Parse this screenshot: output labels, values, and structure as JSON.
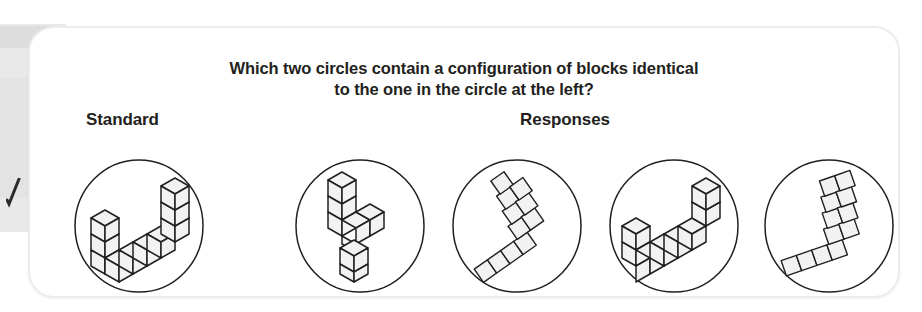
{
  "page": {
    "kind": "scanned-textbook-figure",
    "background_color": "#ffffff",
    "card_color": "#ffffff",
    "card_border_color": "#ececed",
    "ink_color": "#231f20",
    "block_face_color": "#f2f2f2",
    "scan_artifact_color": "#e8e8e8"
  },
  "question": {
    "line1": "Which two circles contain a configuration of blocks identical",
    "line2": "to the one in the circle at the left?"
  },
  "labels": {
    "standard": "Standard",
    "responses": "Responses"
  },
  "figure": {
    "standard_count": 1,
    "response_count": 4,
    "items": [
      {
        "id": "standard",
        "group": "standard",
        "name": "standard-block-figure",
        "description": "isometric checkmark of ten cubes, short arm lower-left, long arm rising to upper-right"
      },
      {
        "id": "response-1",
        "group": "response",
        "name": "response-block-figure-1",
        "description": "isometric figure with vertical column at top-left and detached lower column, not identical"
      },
      {
        "id": "response-2",
        "group": "response",
        "name": "response-block-figure-2",
        "description": "flat checkmark rotated, short arm to lower-left and long arm to upper-right"
      },
      {
        "id": "response-3",
        "group": "response",
        "name": "response-block-figure-3",
        "description": "isometric checkmark matching the standard, rotated"
      },
      {
        "id": "response-4",
        "group": "response",
        "name": "response-block-figure-4",
        "description": "flat checkmark with long arm near-vertical and short arm to lower-left"
      }
    ]
  }
}
